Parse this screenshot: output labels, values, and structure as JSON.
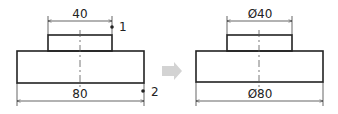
{
  "left_figure": {
    "dim_top": "40",
    "dim_bottom": "80",
    "marker_1": "1",
    "marker_2": "2"
  },
  "right_figure": {
    "dim_top": "Ø40",
    "dim_bottom": "Ø80"
  },
  "colors": {
    "line": "#222222",
    "arrow": "#d3d3d3",
    "centerline": "#555555"
  }
}
